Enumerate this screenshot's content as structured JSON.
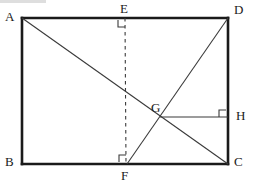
{
  "figure": {
    "type": "geometry-diagram",
    "background_color": "#ffffff",
    "stroke_color": "#1a1a1a",
    "thin_stroke_color": "#3a3a3a"
  },
  "rectangle": {
    "name": "ABCD",
    "left": 22,
    "top": 18,
    "right": 228,
    "bottom": 164,
    "stroke_width": 2.6
  },
  "points": {
    "A": {
      "x": 22,
      "y": 18
    },
    "B": {
      "x": 22,
      "y": 164
    },
    "C": {
      "x": 228,
      "y": 164
    },
    "D": {
      "x": 228,
      "y": 18
    },
    "E": {
      "x": 125,
      "y": 18
    },
    "F": {
      "x": 127,
      "y": 164
    },
    "G": {
      "x": 160,
      "y": 117
    },
    "H": {
      "x": 228,
      "y": 117
    }
  },
  "labels": [
    {
      "id": "A",
      "text": "A",
      "x": 5,
      "y": 10
    },
    {
      "id": "B",
      "text": "B",
      "x": 5,
      "y": 157
    },
    {
      "id": "C",
      "text": "C",
      "x": 234,
      "y": 157
    },
    {
      "id": "D",
      "text": "D",
      "x": 234,
      "y": 4
    },
    {
      "id": "E",
      "text": "E",
      "x": 120,
      "y": 2
    },
    {
      "id": "F",
      "text": "F",
      "x": 122,
      "y": 170
    },
    {
      "id": "G",
      "text": "G",
      "x": 152,
      "y": 102
    },
    {
      "id": "H",
      "text": "H",
      "x": 236,
      "y": 110
    }
  ],
  "segments": [
    {
      "id": "AD",
      "from": "A",
      "to": "D",
      "style": "solid-thick",
      "kind": "rectangle-side"
    },
    {
      "id": "AB",
      "from": "A",
      "to": "B",
      "style": "solid-thick",
      "kind": "rectangle-side"
    },
    {
      "id": "BC",
      "from": "B",
      "to": "C",
      "style": "solid-thick",
      "kind": "rectangle-side"
    },
    {
      "id": "DC",
      "from": "D",
      "to": "C",
      "style": "solid-thick",
      "kind": "rectangle-side"
    },
    {
      "id": "AC",
      "from": "A",
      "to": "C",
      "style": "solid-thin",
      "kind": "diagonal"
    },
    {
      "id": "FD",
      "from": "F",
      "to": "D",
      "style": "solid-thin",
      "kind": "cevian"
    },
    {
      "id": "EF",
      "from": "E",
      "to": "F",
      "style": "dashed",
      "kind": "perpendicular"
    },
    {
      "id": "GH",
      "from": "G",
      "to": "H",
      "style": "solid-thin",
      "kind": "perpendicular"
    }
  ],
  "right_angle_marks": [
    {
      "id": "right-angle-at-E",
      "at": "E",
      "size": 7,
      "orientation": "below-left"
    },
    {
      "id": "right-angle-at-F",
      "at": "F",
      "size": 7,
      "orientation": "above-left"
    },
    {
      "id": "right-angle-at-H",
      "at": "H",
      "size": 7,
      "orientation": "above-left"
    }
  ]
}
